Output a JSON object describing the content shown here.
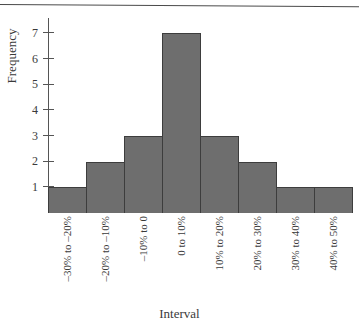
{
  "chart_data": {
    "type": "bar",
    "title": "",
    "xlabel": "Interval",
    "ylabel": "Frequency",
    "categories": [
      "–30% to –20%",
      "–20% to –10%",
      "–10% to 0",
      "0 to 10%",
      "10% to 20%",
      "20% to 30%",
      "30% to 40%",
      "40% to 50%"
    ],
    "values": [
      1,
      2,
      3,
      7,
      3,
      2,
      1,
      1
    ],
    "ylim": [
      0,
      7.6
    ],
    "yticks": [
      1,
      2,
      3,
      4,
      5,
      6,
      7
    ],
    "ytick_labels": [
      "1",
      "2",
      "3",
      "4",
      "5",
      "6",
      "7"
    ],
    "grid": false,
    "legend": null,
    "bar_color": "#6e6e6e",
    "bar_edge_color": "#3d3d3d",
    "background_color": "#ffffff"
  },
  "axes": {
    "y_title": "Frequency",
    "x_title": "Interval"
  }
}
